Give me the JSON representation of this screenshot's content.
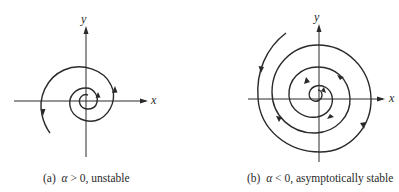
{
  "figure": {
    "panels": [
      {
        "id": "a",
        "caption_prefix": "(a)",
        "caption_var": "α",
        "caption_rest": " > 0, unstable",
        "x_label": "x",
        "y_label": "y",
        "behavior": "spiral source (outward, counterclockwise)",
        "alpha_sign": "> 0",
        "stability": "unstable"
      },
      {
        "id": "b",
        "caption_prefix": "(b)",
        "caption_var": "α",
        "caption_rest": " < 0, asymptotically stable",
        "x_label": "x",
        "y_label": "y",
        "behavior": "spiral sink (inward, counterclockwise)",
        "alpha_sign": "< 0",
        "stability": "asymptotically stable"
      }
    ],
    "colors": {
      "ink": "#2a2a2a",
      "background": "#ffffff"
    }
  }
}
